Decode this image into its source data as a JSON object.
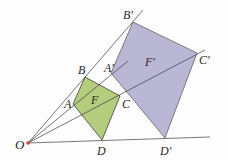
{
  "diagram": {
    "type": "homothety",
    "colors": {
      "original_fill": "#b4cc7e",
      "image_fill": "#b9b7d4",
      "line": "#3c3c3c",
      "center_point": "#d9453a",
      "background": "#fdfdfd"
    },
    "center": {
      "label": "O",
      "x": 28,
      "y": 143
    },
    "original": {
      "label": "F",
      "vertices": [
        {
          "label": "A",
          "x": 73,
          "y": 104
        },
        {
          "label": "B",
          "x": 85,
          "y": 77
        },
        {
          "label": "C",
          "x": 120,
          "y": 96
        },
        {
          "label": "D",
          "x": 102,
          "y": 140
        }
      ]
    },
    "image": {
      "label": "F'",
      "vertices": [
        {
          "label": "A'",
          "x": 111,
          "y": 73
        },
        {
          "label": "B'",
          "x": 133,
          "y": 22
        },
        {
          "label": "C'",
          "x": 197,
          "y": 53
        },
        {
          "label": "D'",
          "x": 165,
          "y": 138
        }
      ]
    },
    "rays": [
      {
        "to": "B'",
        "end_x": 143,
        "end_y": 10
      },
      {
        "to": "A'",
        "end_x": 128,
        "end_y": 61
      },
      {
        "to": "C'",
        "end_x": 205,
        "end_y": 50
      },
      {
        "to": "D'",
        "end_x": 210,
        "end_y": 137
      }
    ],
    "labels": {
      "O": "O",
      "A": "A",
      "B": "B",
      "C": "C",
      "D": "D",
      "F": "F",
      "A_prime": "A'",
      "B_prime": "B'",
      "C_prime": "C'",
      "D_prime": "D'",
      "F_prime": "F'"
    }
  }
}
